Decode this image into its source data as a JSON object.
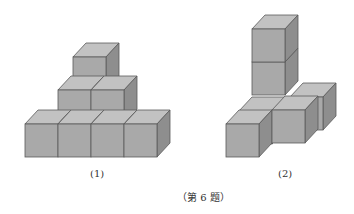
{
  "figure1": {
    "label": "(1)",
    "description": "Stack of cubes: 4 on bottom row, 2 on middle row, 1 on top"
  },
  "figure2": {
    "label": "(2)",
    "description": "Tower of 2 cubes at back, with 3 cubes in front forming an L/T base"
  },
  "caption": "（第 6 题）",
  "colors": {
    "front": "#a9a9a9",
    "top": "#c2c2c2",
    "side": "#8e8e8e",
    "edge": "#5a5a5a"
  }
}
